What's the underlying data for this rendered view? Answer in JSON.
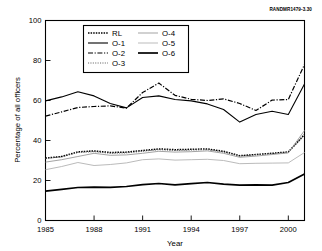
{
  "figure": {
    "rand_id": "RANDMR1479-3.30"
  },
  "legend": {
    "entries": [
      {
        "label": "RL",
        "style": "dotted-bold",
        "color": "#000000",
        "column": "left"
      },
      {
        "label": "O-1",
        "style": "solid",
        "color": "#000000",
        "column": "left"
      },
      {
        "label": "O-2",
        "style": "dash-dot",
        "color": "#000000",
        "column": "left"
      },
      {
        "label": "O-3",
        "style": "fine-dotted",
        "color": "#555555",
        "column": "left"
      },
      {
        "label": "O-4",
        "style": "thin-solid",
        "color": "#999999",
        "column": "right"
      },
      {
        "label": "O-5",
        "style": "light-solid",
        "color": "#bbbbbb",
        "column": "right"
      },
      {
        "label": "O-6",
        "style": "thick-solid",
        "color": "#000000",
        "column": "right"
      }
    ]
  },
  "chart_data": {
    "type": "line",
    "title": "",
    "xlabel": "Year",
    "ylabel": "Percentage of all officers",
    "xlim": [
      1985,
      2001
    ],
    "ylim": [
      0,
      100
    ],
    "xticks": [
      1985,
      1988,
      1991,
      1994,
      1997,
      2000
    ],
    "yticks": [
      0,
      20,
      40,
      60,
      80,
      100
    ],
    "grid": false,
    "legend_position": "upper-center",
    "x": [
      1985,
      1986,
      1987,
      1988,
      1989,
      1990,
      1991,
      1992,
      1993,
      1994,
      1995,
      1996,
      1997,
      1998,
      1999,
      2000,
      2001
    ],
    "series": [
      {
        "name": "RL",
        "style": "dotted-bold",
        "color": "#000000",
        "values": [
          31.2,
          32.0,
          34.3,
          34.8,
          34.0,
          34.2,
          35.0,
          35.8,
          35.4,
          35.6,
          35.8,
          34.6,
          32.4,
          33.0,
          33.6,
          34.3,
          43.0
        ]
      },
      {
        "name": "O-1",
        "style": "solid",
        "color": "#000000",
        "values": [
          59.8,
          61.8,
          64.4,
          62.3,
          58.5,
          56.3,
          61.5,
          62.3,
          60.5,
          59.8,
          58.3,
          55.5,
          49.2,
          53.0,
          54.6,
          53.0,
          68.2
        ]
      },
      {
        "name": "O-2",
        "style": "dash-dot",
        "color": "#000000",
        "values": [
          52.2,
          54.3,
          56.5,
          57.0,
          57.3,
          56.2,
          64.0,
          68.7,
          62.6,
          60.6,
          60.0,
          60.8,
          58.5,
          55.0,
          60.2,
          60.5,
          78.0
        ]
      },
      {
        "name": "O-3",
        "style": "fine-dotted",
        "color": "#555555",
        "values": [
          31.0,
          31.8,
          34.0,
          34.4,
          33.6,
          33.8,
          34.6,
          35.4,
          35.0,
          35.2,
          35.4,
          34.2,
          32.2,
          32.8,
          33.4,
          34.0,
          42.5
        ]
      },
      {
        "name": "O-4",
        "style": "thin-solid",
        "color": "#999999",
        "values": [
          29.2,
          30.4,
          32.0,
          33.6,
          32.6,
          32.8,
          33.6,
          34.6,
          34.2,
          34.4,
          34.8,
          33.6,
          31.6,
          32.2,
          33.0,
          33.8,
          45.0
        ]
      },
      {
        "name": "O-5",
        "style": "light-solid",
        "color": "#bbbbbb",
        "values": [
          25.4,
          27.0,
          29.0,
          27.5,
          28.0,
          28.8,
          30.4,
          30.8,
          30.2,
          30.4,
          30.6,
          30.0,
          28.4,
          28.6,
          28.7,
          28.8,
          34.0
        ]
      },
      {
        "name": "O-6",
        "style": "thick-solid",
        "color": "#000000",
        "values": [
          14.7,
          15.6,
          16.5,
          16.7,
          16.6,
          17.0,
          17.9,
          18.5,
          17.8,
          18.4,
          19.0,
          18.2,
          17.7,
          17.8,
          17.7,
          19.0,
          23.3
        ]
      }
    ]
  }
}
